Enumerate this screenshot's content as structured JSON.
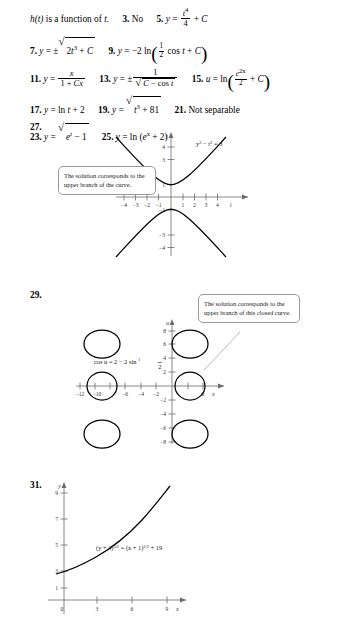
{
  "answers": {
    "intro": "h(t) is a function of t.",
    "items": [
      {
        "num": "3.",
        "text": "No"
      },
      {
        "num": "5.",
        "text": "y = t⁴/4 + C"
      },
      {
        "num": "7.",
        "text": "y = ±√(2t³ + C)"
      },
      {
        "num": "9.",
        "text": "y = −2 ln((1/2) cos t + C)"
      },
      {
        "num": "11.",
        "text": "y = x/(1 + Cx)"
      },
      {
        "num": "13.",
        "text": "y = ±1/√(C − cos t)"
      },
      {
        "num": "15.",
        "text": "u = ln(e^(2x)/2 + C)"
      },
      {
        "num": "17.",
        "text": "y = ln t + 2"
      },
      {
        "num": "19.",
        "text": "y = √(t³ + 81)"
      },
      {
        "num": "21.",
        "text": "Not separable"
      },
      {
        "num": "23.",
        "text": "y = √(e^t − 1)"
      },
      {
        "num": "25.",
        "text": "y = ln (e^x + 2)"
      },
      {
        "num": "27.",
        "text": ""
      },
      {
        "num": "29.",
        "text": ""
      },
      {
        "num": "31.",
        "text": ""
      }
    ]
  },
  "figures": [
    {
      "number": "27.",
      "equation": "y² − t² = 3",
      "callout": "The solution corresponds to the upper branch of the curve.",
      "xlabel": "t",
      "ylabel": "y",
      "xticks": [
        "−4",
        "−3",
        "−2",
        "−1",
        "1",
        "2",
        "3",
        "4"
      ],
      "yticks": [
        "4",
        "3",
        "1",
        "−1",
        "−3",
        "−4"
      ]
    },
    {
      "number": "29.",
      "equation": "cos u = 2 − 2 sin(x/2)",
      "callout": "The solution corresponds to the upper branch of this closed curve.",
      "xlabel": "x",
      "ylabel": "u",
      "xticks": [
        "−12",
        "−10",
        "−6",
        "−4",
        "−2",
        "6"
      ],
      "yticks": [
        "8",
        "6",
        "4",
        "2",
        "−2",
        "−4",
        "−6",
        "−8"
      ]
    },
    {
      "number": "31.",
      "equation": "(y + 4)³ᐟ² = (x + 1)³ᐟ² + 19",
      "xlabel": "x",
      "ylabel": "y",
      "xticks": [
        "0",
        "3",
        "6",
        "9"
      ],
      "yticks": [
        "1",
        "3",
        "5",
        "7",
        "9"
      ]
    }
  ],
  "colors": {
    "ink": "#000000",
    "axis": "#6b6b6b",
    "callout_border": "#9a9a9a"
  }
}
